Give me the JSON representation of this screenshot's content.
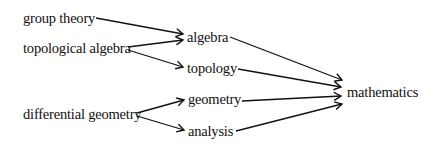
{
  "diagram": {
    "type": "directed-graph",
    "nodes": [
      {
        "id": "group_theory",
        "label": "group theory",
        "x": 23,
        "y": 18
      },
      {
        "id": "topological_algebra",
        "label": "topological algebra",
        "x": 23,
        "y": 48
      },
      {
        "id": "differential_geometry",
        "label": "differential geometry",
        "x": 23,
        "y": 114
      },
      {
        "id": "algebra",
        "label": "algebra",
        "x": 187,
        "y": 37
      },
      {
        "id": "topology",
        "label": "topology",
        "x": 187,
        "y": 68
      },
      {
        "id": "geometry",
        "label": "geometry",
        "x": 188,
        "y": 99
      },
      {
        "id": "analysis",
        "label": "analysis",
        "x": 188,
        "y": 131
      },
      {
        "id": "mathematics",
        "label": "mathematics",
        "x": 347,
        "y": 92
      }
    ],
    "edges": [
      {
        "from": "group_theory",
        "to": "algebra"
      },
      {
        "from": "topological_algebra",
        "to": "algebra"
      },
      {
        "from": "topological_algebra",
        "to": "topology"
      },
      {
        "from": "differential_geometry",
        "to": "geometry"
      },
      {
        "from": "differential_geometry",
        "to": "analysis"
      },
      {
        "from": "algebra",
        "to": "mathematics"
      },
      {
        "from": "topology",
        "to": "mathematics"
      },
      {
        "from": "geometry",
        "to": "mathematics"
      },
      {
        "from": "analysis",
        "to": "mathematics"
      }
    ],
    "colors": {
      "line": "#111111",
      "text": "#111111",
      "background": "#ffffff"
    }
  }
}
